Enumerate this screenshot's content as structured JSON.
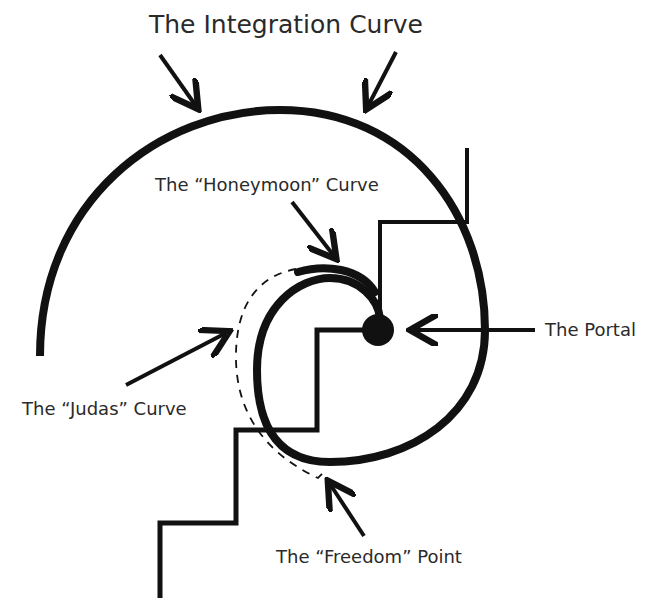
{
  "diagram": {
    "title": "The Integration Curve",
    "labels": {
      "honeymoon": "The “Honeymoon” Curve",
      "portal": "The Portal",
      "judas": "The “Judas” Curve",
      "freedom": "The “Freedom” Point"
    },
    "colors": {
      "ink": "#111111",
      "text": "#2a2a2a",
      "background": "#ffffff"
    },
    "elements": [
      "integration-curve (large outer spiral arc)",
      "honeymoon-curve (short thick arc above inner spiral)",
      "judas-curve (dashed arc)",
      "portal (filled circle at spiral center)",
      "freedom-point (end of dashed curve)",
      "staircase (ascending steps)"
    ]
  }
}
